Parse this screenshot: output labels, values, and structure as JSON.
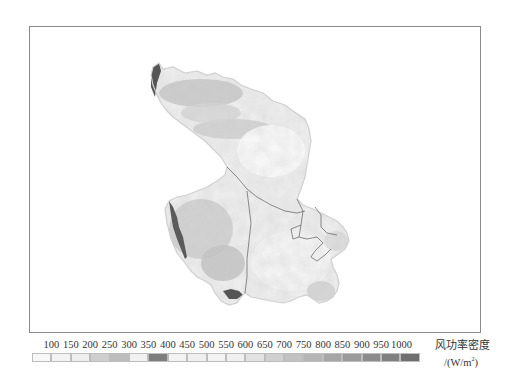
{
  "figure": {
    "type": "raster-map",
    "frame": {
      "border_color": "#8a8a8a"
    }
  },
  "map": {
    "colors": {
      "very_light": "#f4f4f4",
      "light": "#e4e4e4",
      "medium_light": "#d2d2d2",
      "medium": "#b8b8b8",
      "dark": "#7a7a7a",
      "very_dark": "#555555",
      "boundary_line": "#6e6e6e"
    }
  },
  "legend": {
    "title": "风功率密度",
    "unit_prefix": "/(W/m",
    "unit_sup": "2",
    "unit_suffix": ")",
    "ticks": [
      "100",
      "150",
      "200",
      "250",
      "300",
      "350",
      "400",
      "450",
      "500",
      "550",
      "600",
      "650",
      "700",
      "750",
      "800",
      "850",
      "900",
      "950",
      "1000"
    ],
    "swatches": [
      {
        "color": "#f7f7f7"
      },
      {
        "color": "#f3f3f3"
      },
      {
        "color": "#eeeeee"
      },
      {
        "color": "#cfcfcf"
      },
      {
        "color": "#bdbdbd"
      },
      {
        "color": "#f1f1f1"
      },
      {
        "color": "#7d7d7d"
      },
      {
        "color": "#f3f3f3"
      },
      {
        "color": "#f0f0f0"
      },
      {
        "color": "#f3f3f3"
      },
      {
        "color": "#f0f0f0"
      },
      {
        "color": "#e2e2e2"
      },
      {
        "color": "#d0d0d0"
      },
      {
        "color": "#c2c2c2"
      },
      {
        "color": "#b5b5b5"
      },
      {
        "color": "#a6a6a6"
      },
      {
        "color": "#9a9a9a"
      },
      {
        "color": "#8c8c8c"
      },
      {
        "color": "#808080"
      },
      {
        "color": "#6f6f6f"
      }
    ]
  }
}
